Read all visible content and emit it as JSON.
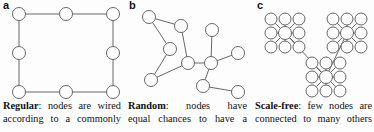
{
  "figure": {
    "width": 374,
    "height": 132,
    "background": "#fdfdfd",
    "stroke_color": "#555555",
    "node_fill": "#ffffff",
    "text_color": "#111111"
  },
  "panels": [
    {
      "letter": "a",
      "caption_lead": "Regular",
      "caption_sep": ":",
      "caption_line1_words": [
        "nodes",
        "are",
        "wired"
      ],
      "caption_line2_words": [
        "according",
        "to",
        "a",
        "commonly"
      ],
      "caption_full": "Regular: nodes are wired according to a commonly",
      "graph": {
        "type": "ring-lattice",
        "node_radius": 6.5,
        "nodes": [
          {
            "id": "a1",
            "x": 19,
            "y": 14
          },
          {
            "id": "a2",
            "x": 66,
            "y": 14
          },
          {
            "id": "a3",
            "x": 113,
            "y": 14
          },
          {
            "id": "a4",
            "x": 113,
            "y": 53
          },
          {
            "id": "a5",
            "x": 113,
            "y": 92
          },
          {
            "id": "a6",
            "x": 66,
            "y": 92
          },
          {
            "id": "a7",
            "x": 19,
            "y": 92
          },
          {
            "id": "a8",
            "x": 19,
            "y": 53
          }
        ],
        "edges": [
          [
            "a1",
            "a2"
          ],
          [
            "a2",
            "a3"
          ],
          [
            "a3",
            "a4"
          ],
          [
            "a4",
            "a5"
          ],
          [
            "a5",
            "a6"
          ],
          [
            "a6",
            "a7"
          ],
          [
            "a7",
            "a8"
          ],
          [
            "a8",
            "a1"
          ]
        ]
      }
    },
    {
      "letter": "b",
      "caption_lead": "Random",
      "caption_sep": ":",
      "caption_line1_words": [
        "nodes",
        "have"
      ],
      "caption_line2_words": [
        "equal",
        "chances",
        "to",
        "have",
        "a"
      ],
      "caption_full": "Random: nodes have equal chances to have a",
      "graph": {
        "type": "random",
        "node_radius": 6.5,
        "nodes": [
          {
            "id": "b1",
            "x": 25,
            "y": 17
          },
          {
            "id": "b2",
            "x": 57,
            "y": 26
          },
          {
            "id": "b3",
            "x": 46,
            "y": 49
          },
          {
            "id": "b4",
            "x": 27,
            "y": 80
          },
          {
            "id": "b5",
            "x": 64,
            "y": 63
          },
          {
            "id": "b6",
            "x": 88,
            "y": 30
          },
          {
            "id": "b7",
            "x": 87,
            "y": 63
          },
          {
            "id": "b8",
            "x": 114,
            "y": 53
          },
          {
            "id": "b9",
            "x": 79,
            "y": 86
          },
          {
            "id": "b10",
            "x": 114,
            "y": 92
          }
        ],
        "edges": [
          [
            "b1",
            "b2"
          ],
          [
            "b1",
            "b3"
          ],
          [
            "b3",
            "b4"
          ],
          [
            "b4",
            "b5"
          ],
          [
            "b2",
            "b5"
          ],
          [
            "b5",
            "b7"
          ],
          [
            "b6",
            "b7"
          ],
          [
            "b7",
            "b8"
          ],
          [
            "b7",
            "b9"
          ],
          [
            "b9",
            "b10"
          ]
        ]
      }
    },
    {
      "letter": "c",
      "caption_lead": "Scale-free",
      "caption_sep": ":",
      "caption_line1_words": [
        "few",
        "nodes",
        "are"
      ],
      "caption_line2_words": [
        "connected",
        "to",
        "many",
        "others"
      ],
      "caption_full": "Scale-free: few nodes are connected to many others",
      "graph": {
        "type": "scale-free",
        "node_radius": 6.0,
        "hub_radius": 6.5,
        "satellite_offset": 14,
        "hubs": [
          {
            "id": "h1",
            "x": 35,
            "y": 33
          },
          {
            "id": "h2",
            "x": 97,
            "y": 33
          },
          {
            "id": "h3",
            "x": 76,
            "y": 77
          }
        ],
        "hub_edges": [
          [
            "h1",
            "h3"
          ],
          [
            "h2",
            "h3"
          ]
        ],
        "satellite_directions": [
          {
            "dx": -1,
            "dy": -1
          },
          {
            "dx": 0,
            "dy": -1
          },
          {
            "dx": 1,
            "dy": -1
          },
          {
            "dx": -1,
            "dy": 0
          },
          {
            "dx": 1,
            "dy": 0
          },
          {
            "dx": -1,
            "dy": 1
          },
          {
            "dx": 0,
            "dy": 1
          },
          {
            "dx": 1,
            "dy": 1
          }
        ]
      }
    }
  ]
}
